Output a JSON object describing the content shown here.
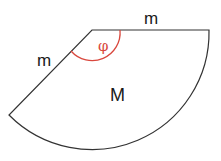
{
  "diagram": {
    "type": "circular-sector",
    "labels": {
      "top_edge": "m",
      "left_edge": "m",
      "angle": "φ",
      "center": "M"
    },
    "colors": {
      "outline": "#333333",
      "angle_arc": "#d9473d",
      "background": "#ffffff"
    }
  }
}
